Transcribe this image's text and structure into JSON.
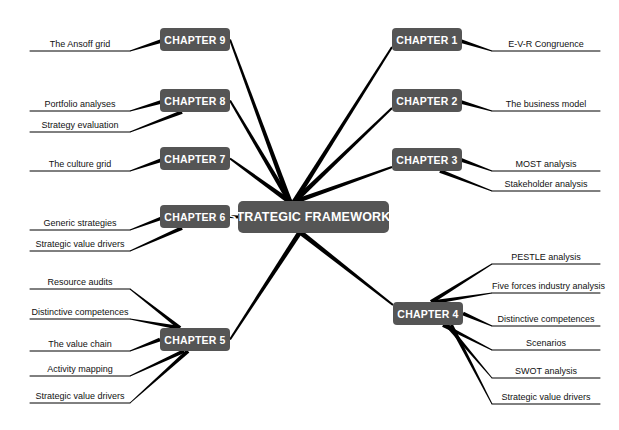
{
  "title": "STRATEGIC FRAMEWORKS",
  "colors": {
    "node_fill": "#555555",
    "node_text": "#ffffff",
    "line": "#000000",
    "background": "#ffffff"
  },
  "center": {
    "label": "STRATEGIC FRAMEWORKS",
    "x": 238,
    "y": 201
  },
  "chapters": [
    {
      "id": "ch1",
      "label": "CHAPTER 1",
      "x": 392,
      "y": 28,
      "side": "right",
      "topics": [
        {
          "label": "E-V-R Congruence",
          "y": 50
        }
      ]
    },
    {
      "id": "ch2",
      "label": "CHAPTER 2",
      "x": 392,
      "y": 89,
      "side": "right",
      "topics": [
        {
          "label": "The business model",
          "y": 110
        }
      ]
    },
    {
      "id": "ch3",
      "label": "CHAPTER 3",
      "x": 392,
      "y": 148,
      "side": "right",
      "topics": [
        {
          "label": "MOST analysis",
          "y": 170
        },
        {
          "label": "Stakeholder analysis",
          "y": 190
        }
      ]
    },
    {
      "id": "ch4",
      "label": "CHAPTER 4",
      "x": 393,
      "y": 302,
      "side": "right",
      "topics": [
        {
          "label": "PESTLE analysis",
          "y": 263
        },
        {
          "label": "Five forces industry analysis",
          "y": 292
        },
        {
          "label": "Distinctive competences",
          "y": 325
        },
        {
          "label": "Scenarios",
          "y": 349
        },
        {
          "label": "SWOT analysis",
          "y": 377
        },
        {
          "label": "Strategic value drivers",
          "y": 403
        }
      ]
    },
    {
      "id": "ch5",
      "label": "CHAPTER 5",
      "x": 160,
      "y": 328,
      "side": "left",
      "topics": [
        {
          "label": "Resource audits",
          "y": 288
        },
        {
          "label": "Distinctive competences",
          "y": 318
        },
        {
          "label": "The value chain",
          "y": 350
        },
        {
          "label": "Activity mapping",
          "y": 375
        },
        {
          "label": "Strategic value drivers",
          "y": 402
        }
      ]
    },
    {
      "id": "ch6",
      "label": "CHAPTER 6",
      "x": 160,
      "y": 205,
      "side": "left",
      "topics": [
        {
          "label": "Generic strategies",
          "y": 229
        },
        {
          "label": "Strategic value drivers",
          "y": 250
        }
      ]
    },
    {
      "id": "ch7",
      "label": "CHAPTER 7",
      "x": 160,
      "y": 147,
      "side": "left",
      "topics": [
        {
          "label": "The culture grid",
          "y": 170
        }
      ]
    },
    {
      "id": "ch8",
      "label": "CHAPTER 8",
      "x": 160,
      "y": 89,
      "side": "left",
      "topics": [
        {
          "label": "Portfolio analyses",
          "y": 110
        },
        {
          "label": "Strategy evaluation",
          "y": 131
        }
      ]
    },
    {
      "id": "ch9",
      "label": "CHAPTER 9",
      "x": 160,
      "y": 28,
      "side": "left",
      "topics": [
        {
          "label": "The Ansoff grid",
          "y": 50
        }
      ]
    }
  ]
}
